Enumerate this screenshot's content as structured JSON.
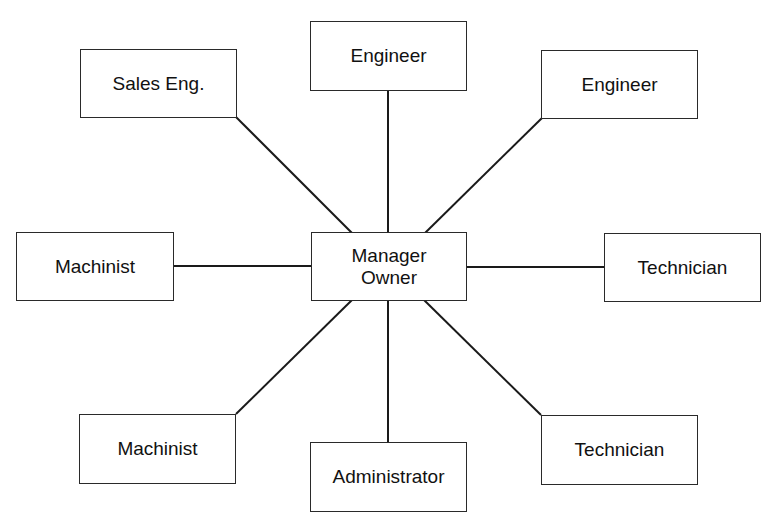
{
  "diagram": {
    "type": "organizational star diagram",
    "center": {
      "id": "manager-owner",
      "label": "Manager\nOwner"
    },
    "nodes": [
      {
        "id": "sales-eng",
        "label": "Sales Eng."
      },
      {
        "id": "engineer-top",
        "label": "Engineer"
      },
      {
        "id": "engineer-right",
        "label": "Engineer"
      },
      {
        "id": "machinist-left",
        "label": "Machinist"
      },
      {
        "id": "technician-right",
        "label": "Technician"
      },
      {
        "id": "machinist-bottom",
        "label": "Machinist"
      },
      {
        "id": "administrator",
        "label": "Administrator"
      },
      {
        "id": "technician-bottom",
        "label": "Technician"
      }
    ],
    "edges": [
      {
        "from": "manager-owner",
        "to": "sales-eng"
      },
      {
        "from": "manager-owner",
        "to": "engineer-top"
      },
      {
        "from": "manager-owner",
        "to": "engineer-right"
      },
      {
        "from": "manager-owner",
        "to": "machinist-left"
      },
      {
        "from": "manager-owner",
        "to": "technician-right"
      },
      {
        "from": "manager-owner",
        "to": "machinist-bottom"
      },
      {
        "from": "manager-owner",
        "to": "administrator"
      },
      {
        "from": "manager-owner",
        "to": "technician-bottom"
      }
    ]
  }
}
